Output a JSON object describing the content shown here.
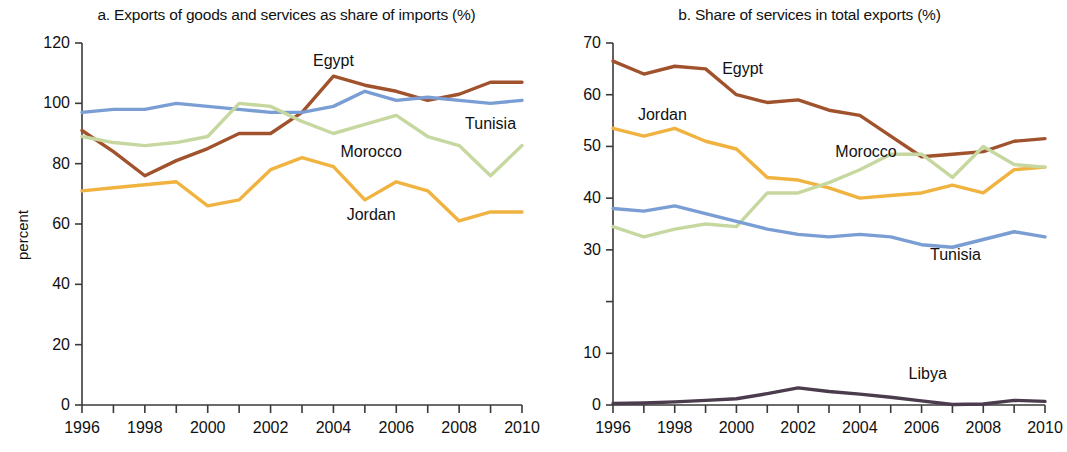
{
  "figure": {
    "ylabel": "percent"
  },
  "panels": [
    {
      "key": "a",
      "title": "a.  Exports of goods and services as share of imports (%)",
      "ylabel": "percent"
    },
    {
      "key": "b",
      "title": "b.  Share of services in total exports (%)",
      "ylabel": "percent"
    }
  ],
  "colors": {
    "egypt": "#a0522d",
    "tunisia": "#7a9ed4",
    "morocco": "#c6d8a0",
    "jordan": "#f0b340",
    "libya": "#4a3c4c",
    "axis": "#3a3a3a",
    "text": "#111111"
  },
  "chart_data": [
    {
      "type": "line",
      "panel": "a",
      "title": "a.  Exports of goods and services as share of imports (%)",
      "xlabel": "",
      "ylabel": "percent",
      "x": [
        1996,
        1997,
        1998,
        1999,
        2000,
        2001,
        2002,
        2003,
        2004,
        2005,
        2006,
        2007,
        2008,
        2009,
        2010
      ],
      "xlim": [
        1996,
        2010
      ],
      "ylim": [
        0,
        120
      ],
      "yticks": [
        0,
        20,
        40,
        60,
        80,
        100,
        120
      ],
      "ytick_labels": [
        "0",
        "20",
        "40",
        "60",
        "80",
        "100",
        "120"
      ],
      "xticks": [
        1996,
        1997,
        1998,
        1999,
        2000,
        2001,
        2002,
        2003,
        2004,
        2005,
        2006,
        2007,
        2008,
        2009,
        2010
      ],
      "xtick_labels": [
        "1996",
        "",
        "1998",
        "",
        "2000",
        "",
        "2002",
        "",
        "2004",
        "",
        "2006",
        "",
        "2008",
        "",
        "2010"
      ],
      "grid": false,
      "legend": "inline-annotations",
      "series": [
        {
          "name": "Egypt",
          "color": "#a0522d",
          "values": [
            91,
            84,
            76,
            81,
            85,
            90,
            90,
            97,
            109,
            106,
            104,
            101,
            103,
            107,
            107
          ]
        },
        {
          "name": "Tunisia",
          "color": "#7a9ed4",
          "values": [
            97,
            98,
            98,
            100,
            99,
            98,
            97,
            97,
            99,
            104,
            101,
            102,
            101,
            100,
            101
          ]
        },
        {
          "name": "Morocco",
          "color": "#c6d8a0",
          "values": [
            89,
            87,
            86,
            87,
            89,
            100,
            99,
            94,
            90,
            93,
            96,
            89,
            86,
            76,
            86
          ]
        },
        {
          "name": "Jordan",
          "color": "#f0b340",
          "values": [
            71,
            72,
            73,
            74,
            66,
            68,
            78,
            82,
            79,
            68,
            74,
            71,
            61,
            64,
            64
          ]
        }
      ],
      "annotations": [
        {
          "label": "Egypt",
          "x": 2004,
          "y": 114
        },
        {
          "label": "Tunisia",
          "x": 2009,
          "y": 93
        },
        {
          "label": "Morocco",
          "x": 2005.2,
          "y": 84
        },
        {
          "label": "Jordan",
          "x": 2005.2,
          "y": 63
        }
      ]
    },
    {
      "type": "line",
      "panel": "b",
      "title": "b.  Share of services in total exports (%)",
      "xlabel": "",
      "ylabel": "percent",
      "x": [
        1996,
        1997,
        1998,
        1999,
        2000,
        2001,
        2002,
        2003,
        2004,
        2005,
        2006,
        2007,
        2008,
        2009,
        2010
      ],
      "xlim": [
        1996,
        2010
      ],
      "ylim": [
        0,
        70
      ],
      "yticks": [
        0,
        10,
        20,
        30,
        40,
        50,
        60,
        70
      ],
      "ytick_labels": [
        "0",
        "10",
        "",
        "30",
        "40",
        "50",
        "60",
        "70"
      ],
      "xticks": [
        1996,
        1997,
        1998,
        1999,
        2000,
        2001,
        2002,
        2003,
        2004,
        2005,
        2006,
        2007,
        2008,
        2009,
        2010
      ],
      "xtick_labels": [
        "1996",
        "",
        "1998",
        "",
        "2000",
        "",
        "2002",
        "",
        "2004",
        "",
        "2006",
        "",
        "2008",
        "",
        "2010"
      ],
      "grid": false,
      "legend": "inline-annotations",
      "series": [
        {
          "name": "Egypt",
          "color": "#a0522d",
          "values": [
            66.5,
            64,
            65.5,
            65,
            60,
            58.5,
            59,
            57,
            56,
            52,
            48,
            48.5,
            49,
            51,
            51.5
          ]
        },
        {
          "name": "Jordan",
          "color": "#f0b340",
          "values": [
            53.5,
            52,
            53.5,
            51,
            49.5,
            44,
            43.5,
            42,
            40,
            40.5,
            41,
            42.5,
            41,
            45.5,
            46
          ]
        },
        {
          "name": "Morocco",
          "color": "#c6d8a0",
          "values": [
            34.5,
            32.5,
            34,
            35,
            34.5,
            41,
            41,
            43,
            45.5,
            48.5,
            48.5,
            44,
            50,
            46.5,
            46
          ]
        },
        {
          "name": "Tunisia",
          "color": "#7a9ed4",
          "values": [
            38,
            37.5,
            38.5,
            37,
            35.5,
            34,
            33,
            32.5,
            33,
            32.5,
            31,
            30.5,
            32,
            33.5,
            32.5
          ]
        },
        {
          "name": "Libya",
          "color": "#4a3c4c",
          "values": [
            0.3,
            0.4,
            0.6,
            0.9,
            1.2,
            2.2,
            3.3,
            2.6,
            2.1,
            1.5,
            0.8,
            0.1,
            0.2,
            0.9,
            0.7
          ]
        }
      ],
      "annotations": [
        {
          "label": "Egypt",
          "x": 2000.2,
          "y": 65
        },
        {
          "label": "Jordan",
          "x": 1997.6,
          "y": 56
        },
        {
          "label": "Morocco",
          "x": 2004.2,
          "y": 49
        },
        {
          "label": "Tunisia",
          "x": 2007.1,
          "y": 29
        },
        {
          "label": "Libya",
          "x": 2006.2,
          "y": 6
        }
      ]
    }
  ]
}
